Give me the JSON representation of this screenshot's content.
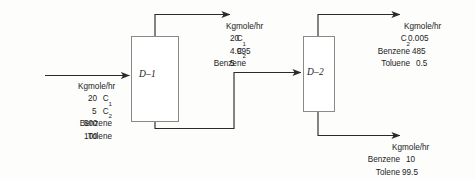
{
  "diagram": {
    "units_label": "Kgmole/hr",
    "line_color": "#2b2b2b",
    "box_color": "#8a8a86"
  },
  "columns": [
    {
      "id": "d1",
      "label": "D–1"
    },
    {
      "id": "d2",
      "label": "D–2"
    }
  ],
  "streams": {
    "feed": {
      "name": "feed-stream",
      "units": "Kgmole/hr",
      "components": [
        {
          "label": "C1",
          "sub": "1",
          "base": "C",
          "value": "20"
        },
        {
          "label": "C2",
          "sub": "2",
          "base": "C",
          "value": "5"
        },
        {
          "label": "Benzene",
          "sub": "",
          "base": "Benzene",
          "value": "500"
        },
        {
          "label": "Tolene",
          "sub": "",
          "base": "Tolene",
          "value": "100"
        }
      ]
    },
    "d1_overhead": {
      "name": "d1-overhead-stream",
      "units": "Kgmole/hr",
      "components": [
        {
          "label": "C1",
          "sub": "1",
          "base": "C",
          "value": "20"
        },
        {
          "label": "C2",
          "sub": "2",
          "base": "C",
          "value": "4.995"
        },
        {
          "label": "Benzene",
          "sub": "",
          "base": "Benzene",
          "value": "5"
        }
      ]
    },
    "d2_overhead": {
      "name": "d2-overhead-stream",
      "units": "Kgmole/hr",
      "components": [
        {
          "label": "C2",
          "sub": "2",
          "base": "C",
          "value": "0.005"
        },
        {
          "label": "Benzene",
          "sub": "",
          "base": "Benzene",
          "value": "485"
        },
        {
          "label": "Toluene",
          "sub": "",
          "base": "Toluene",
          "value": "0.5"
        }
      ]
    },
    "d2_bottoms": {
      "name": "d2-bottoms-stream",
      "units": "Kgmole/hr",
      "components": [
        {
          "label": "Benzene",
          "sub": "",
          "base": "Benzene",
          "value": "10"
        },
        {
          "label": "Tolene",
          "sub": "",
          "base": "Tolene",
          "value": "99.5"
        }
      ]
    }
  }
}
